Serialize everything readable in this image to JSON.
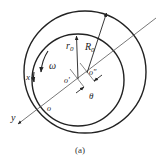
{
  "figure": {
    "caption": "(a)",
    "colors": {
      "stroke": "#222222",
      "background": "#ffffff",
      "thin_line": "#555555"
    }
  },
  "labels": {
    "r0": "r",
    "r0_sub": "0",
    "R0": "R",
    "R0_sub": "0",
    "omega": "ω",
    "x": "x",
    "y": "y",
    "origin": "o",
    "o_prime": "o'",
    "o_double_prime": "o\"",
    "offset": "θ"
  },
  "shapes": {
    "outer_circle": {
      "cx": 85,
      "cy": 72,
      "r": 61
    },
    "inner_circle": {
      "cx": 78,
      "cy": 80,
      "r": 46
    },
    "y_axis": {
      "x1": 156,
      "y1": 18,
      "x2": 17,
      "y2": 125
    }
  }
}
